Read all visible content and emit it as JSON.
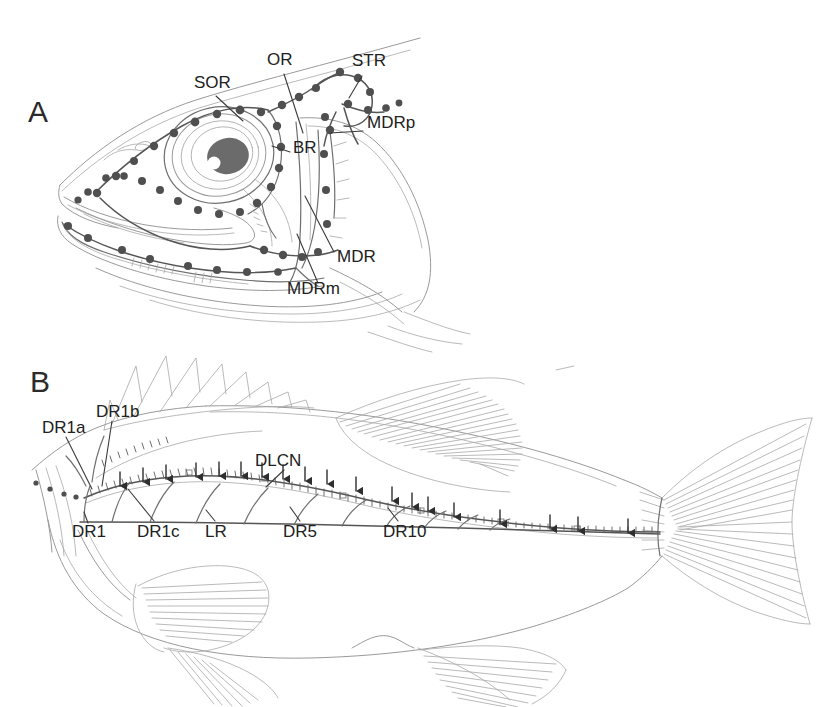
{
  "figure": {
    "background_color": "#ffffff",
    "line_color": "#8a8a8a",
    "dark_line_color": "#4a4a4a",
    "neuromast_color": "#555555",
    "text_color": "#212121",
    "eye_pupil_color": "#6b6b6b",
    "eye_highlight_color": "#ffffff"
  },
  "panels": [
    {
      "id": "A",
      "letter": "A",
      "caption_subject": "fish-head-lateral-view",
      "labels": [
        {
          "key": "sor",
          "text": "SOR",
          "x": 194,
          "y": 82,
          "meaning": "supraorbital-ramus"
        },
        {
          "key": "or",
          "text": "OR",
          "x": 267,
          "y": 59,
          "meaning": "otic-ramus"
        },
        {
          "key": "str",
          "text": "STR",
          "x": 352,
          "y": 60,
          "meaning": "supratemporal-ramus"
        },
        {
          "key": "mdrp",
          "text": "MDRp",
          "x": 367,
          "y": 122,
          "meaning": "mandibular-ramus-posterior"
        },
        {
          "key": "br",
          "text": "BR",
          "x": 293,
          "y": 147,
          "meaning": "buccal-ramus"
        },
        {
          "key": "mdr",
          "text": "MDR",
          "x": 337,
          "y": 256,
          "meaning": "mandibular-ramus"
        },
        {
          "key": "mdrm",
          "text": "MDRm",
          "x": 287,
          "y": 288,
          "meaning": "mandibular-ramus-medial"
        }
      ]
    },
    {
      "id": "B",
      "letter": "B",
      "caption_subject": "whole-fish-lateral-view",
      "labels": [
        {
          "key": "dr1a",
          "text": "DR1a",
          "x": 42,
          "y": 427,
          "meaning": "dorsal-ramus-1a"
        },
        {
          "key": "dr1b",
          "text": "DR1b",
          "x": 96,
          "y": 411,
          "meaning": "dorsal-ramus-1b"
        },
        {
          "key": "dlcn",
          "text": "DLCN",
          "x": 255,
          "y": 460,
          "meaning": "dorsal-lateral-line-canal-nerve"
        },
        {
          "key": "dr1",
          "text": "DR1",
          "x": 72,
          "y": 531,
          "meaning": "dorsal-ramus-1"
        },
        {
          "key": "dr1c",
          "text": "DR1c",
          "x": 137,
          "y": 531,
          "meaning": "dorsal-ramus-1c"
        },
        {
          "key": "lr",
          "text": "LR",
          "x": 205,
          "y": 531,
          "meaning": "lateral-ramus"
        },
        {
          "key": "dr5",
          "text": "DR5",
          "x": 283,
          "y": 531,
          "meaning": "dorsal-ramus-5"
        },
        {
          "key": "dr10",
          "text": "DR10",
          "x": 383,
          "y": 531,
          "meaning": "dorsal-ramus-10"
        }
      ]
    }
  ],
  "panel_a_geometry": {
    "eye": {
      "cx": 219,
      "cy": 155,
      "rings": [
        52,
        45,
        38,
        31
      ],
      "pupil_rx": 20,
      "pupil_ry": 17,
      "pupil_cx": 227,
      "pupil_cy": 156,
      "highlight_cx": 213,
      "highlight_cy": 162,
      "highlight_r": 6
    },
    "neuromast_count": 46
  },
  "panel_b_geometry": {
    "arrow_count": 24,
    "dorsal_ray_count": 9,
    "branch_count": 11,
    "canal_tubule_count": 70
  }
}
